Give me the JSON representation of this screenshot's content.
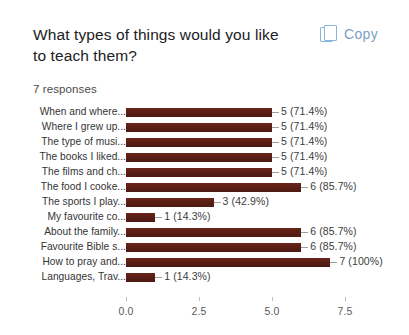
{
  "header": {
    "question": "What types of things would you like to teach them?",
    "responses": "7 responses",
    "copy_label": "Copy",
    "copy_icon": "copy-icon"
  },
  "colors": {
    "bar": "#5c1f16",
    "copy_accent": "#7c9ec4",
    "text": "#202124",
    "axis_text": "#5a5a5a"
  },
  "chart_data": {
    "type": "bar",
    "orientation": "horizontal",
    "title": "What types of things would you like to teach them?",
    "subtitle": "7 responses",
    "xlabel": "",
    "ylabel": "",
    "xlim": [
      0,
      8
    ],
    "grid": false,
    "legend": false,
    "total_responses": 7,
    "categories": [
      "When and where...",
      "Where I grew up...",
      "The type of musi...",
      "The books I liked...",
      "The films and ch...",
      "The food I cooke...",
      "The sports I play...",
      "My favourite co...",
      "About the family...",
      "Favourite Bible s...",
      "How to pray and...",
      "Languages, Trav..."
    ],
    "values": [
      5,
      5,
      5,
      5,
      5,
      6,
      3,
      1,
      6,
      6,
      7,
      1
    ],
    "percents": [
      "71.4%",
      "71.4%",
      "71.4%",
      "71.4%",
      "71.4%",
      "85.7%",
      "42.9%",
      "14.3%",
      "85.7%",
      "85.7%",
      "100%",
      "14.3%"
    ],
    "data_labels": [
      "5 (71.4%)",
      "5 (71.4%)",
      "5 (71.4%)",
      "5 (71.4%)",
      "5 (71.4%)",
      "6 (85.7%)",
      "3 (42.9%)",
      "1 (14.3%)",
      "6 (85.7%)",
      "6 (85.7%)",
      "7 (100%)",
      "1 (14.3%)"
    ],
    "xticks": [
      0,
      2.5,
      5.0,
      7.5
    ],
    "xtick_labels": [
      "0.0",
      "2.5",
      "5.0",
      "7.5"
    ]
  }
}
